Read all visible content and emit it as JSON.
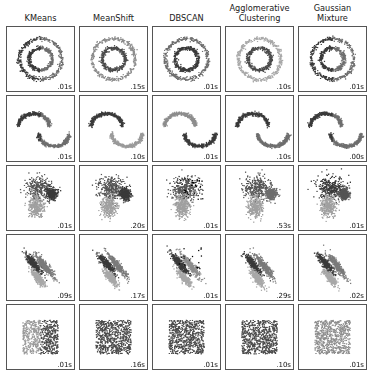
{
  "figure": {
    "title": "",
    "background": "#ffffff",
    "panel_border_color": "#555555"
  },
  "columns": [
    {
      "id": "kmeans",
      "label": "KMeans"
    },
    {
      "id": "meanshift",
      "label": "MeanShift"
    },
    {
      "id": "dbscan",
      "label": "DBSCAN"
    },
    {
      "id": "agglomerative",
      "label": "Agglomerative\nClustering"
    },
    {
      "id": "gaussian_mixture",
      "label": "Gaussian\nMixture"
    }
  ],
  "rows": [
    {
      "id": "noisy_circles",
      "label": ""
    },
    {
      "id": "noisy_moons",
      "label": ""
    },
    {
      "id": "varied_blobs",
      "label": ""
    },
    {
      "id": "aniso_blobs",
      "label": ""
    },
    {
      "id": "uniform_noise",
      "label": ""
    }
  ],
  "timings": {
    "noisy_circles": [
      ".01s",
      ".15s",
      ".01s",
      ".10s",
      ".01s"
    ],
    "noisy_moons": [
      ".01s",
      ".10s",
      ".01s",
      ".10s",
      ".00s"
    ],
    "varied_blobs": [
      ".01s",
      ".20s",
      ".01s",
      ".53s",
      ".01s"
    ],
    "aniso_blobs": [
      ".09s",
      ".17s",
      ".01s",
      ".29s",
      ".02s"
    ],
    "uniform_noise": [
      ".01s",
      ".16s",
      ".01s",
      ".10s",
      ".01s"
    ]
  },
  "palette": {
    "cluster_dark": "#3a3a3a",
    "cluster_mid": "#6e6e6e",
    "cluster_light": "#a8a8a8",
    "cluster_lighter": "#c4c4c4",
    "noise_black": "#000000"
  },
  "chart_data": {
    "type": "scatter",
    "title": "",
    "xlabel": "",
    "ylabel": "",
    "xlim": [
      -2.5,
      2.5
    ],
    "ylim": [
      -2.5,
      2.5
    ],
    "grid": false,
    "legend": null,
    "axis_ticks": "none",
    "layout": {
      "rows": 5,
      "cols": 5,
      "n_samples_per_panel": 1500
    },
    "col_labels": [
      "KMeans",
      "MeanShift",
      "DBSCAN",
      "Agglomerative Clustering",
      "Gaussian Mixture"
    ],
    "row_datasets": [
      "noisy_circles",
      "noisy_moons",
      "varied_blobs",
      "aniso_blobs",
      "uniform_noise"
    ],
    "annotations": [
      {
        "row": "noisy_circles",
        "col": "KMeans",
        "text": ".01s",
        "position": "bottom-right"
      },
      {
        "row": "noisy_circles",
        "col": "MeanShift",
        "text": ".15s",
        "position": "bottom-right"
      },
      {
        "row": "noisy_circles",
        "col": "DBSCAN",
        "text": ".01s",
        "position": "bottom-right"
      },
      {
        "row": "noisy_circles",
        "col": "Agglomerative Clustering",
        "text": ".10s",
        "position": "bottom-right"
      },
      {
        "row": "noisy_circles",
        "col": "Gaussian Mixture",
        "text": ".01s",
        "position": "bottom-right"
      },
      {
        "row": "noisy_moons",
        "col": "KMeans",
        "text": ".01s",
        "position": "bottom-right"
      },
      {
        "row": "noisy_moons",
        "col": "MeanShift",
        "text": ".10s",
        "position": "bottom-right"
      },
      {
        "row": "noisy_moons",
        "col": "DBSCAN",
        "text": ".01s",
        "position": "bottom-right"
      },
      {
        "row": "noisy_moons",
        "col": "Agglomerative Clustering",
        "text": ".10s",
        "position": "bottom-right"
      },
      {
        "row": "noisy_moons",
        "col": "Gaussian Mixture",
        "text": ".00s",
        "position": "bottom-right"
      },
      {
        "row": "varied_blobs",
        "col": "KMeans",
        "text": ".01s",
        "position": "bottom-right"
      },
      {
        "row": "varied_blobs",
        "col": "MeanShift",
        "text": ".20s",
        "position": "bottom-right"
      },
      {
        "row": "varied_blobs",
        "col": "DBSCAN",
        "text": ".01s",
        "position": "bottom-right"
      },
      {
        "row": "varied_blobs",
        "col": "Agglomerative Clustering",
        "text": ".53s",
        "position": "bottom-right"
      },
      {
        "row": "varied_blobs",
        "col": "Gaussian Mixture",
        "text": ".01s",
        "position": "bottom-right"
      },
      {
        "row": "aniso_blobs",
        "col": "KMeans",
        "text": ".09s",
        "position": "bottom-right"
      },
      {
        "row": "aniso_blobs",
        "col": "MeanShift",
        "text": ".17s",
        "position": "bottom-right"
      },
      {
        "row": "aniso_blobs",
        "col": "DBSCAN",
        "text": ".01s",
        "position": "bottom-right"
      },
      {
        "row": "aniso_blobs",
        "col": "Agglomerative Clustering",
        "text": ".29s",
        "position": "bottom-right"
      },
      {
        "row": "aniso_blobs",
        "col": "Gaussian Mixture",
        "text": ".02s",
        "position": "bottom-right"
      },
      {
        "row": "uniform_noise",
        "col": "KMeans",
        "text": ".01s",
        "position": "bottom-right"
      },
      {
        "row": "uniform_noise",
        "col": "MeanShift",
        "text": ".16s",
        "position": "bottom-right"
      },
      {
        "row": "uniform_noise",
        "col": "DBSCAN",
        "text": ".01s",
        "position": "bottom-right"
      },
      {
        "row": "uniform_noise",
        "col": "Agglomerative Clustering",
        "text": ".10s",
        "position": "bottom-right"
      },
      {
        "row": "uniform_noise",
        "col": "Gaussian Mixture",
        "text": ".01s",
        "position": "bottom-right"
      }
    ],
    "panels": [
      {
        "row": "noisy_circles",
        "col": "kmeans",
        "dataset": "circles",
        "clusters": [
          {
            "color": "#6e6e6e",
            "shape": "ring_half",
            "ring": "outer",
            "angle_from": -90,
            "angle_to": 90
          },
          {
            "color": "#3a3a3a",
            "shape": "ring_half",
            "ring": "outer",
            "angle_from": 90,
            "angle_to": 270
          },
          {
            "color": "#6e6e6e",
            "shape": "ring_half",
            "ring": "inner",
            "angle_from": -90,
            "angle_to": 90
          },
          {
            "color": "#3a3a3a",
            "shape": "ring_half",
            "ring": "inner",
            "angle_from": 90,
            "angle_to": 270
          }
        ]
      },
      {
        "row": "noisy_circles",
        "col": "meanshift",
        "dataset": "circles",
        "clusters": [
          {
            "color": "#8d8d8d",
            "shape": "ring",
            "ring": "outer"
          },
          {
            "color": "#4a4a4a",
            "shape": "ring",
            "ring": "inner"
          }
        ]
      },
      {
        "row": "noisy_circles",
        "col": "dbscan",
        "dataset": "circles",
        "clusters": [
          {
            "color": "#6e6e6e",
            "shape": "ring",
            "ring": "outer"
          },
          {
            "color": "#3a3a3a",
            "shape": "ring",
            "ring": "inner"
          }
        ]
      },
      {
        "row": "noisy_circles",
        "col": "agglomerative",
        "dataset": "circles",
        "clusters": [
          {
            "color": "#a8a8a8",
            "shape": "ring",
            "ring": "outer"
          },
          {
            "color": "#4a4a4a",
            "shape": "ring",
            "ring": "inner"
          }
        ]
      },
      {
        "row": "noisy_circles",
        "col": "gaussian_mixture",
        "dataset": "circles",
        "clusters": [
          {
            "color": "#6e6e6e",
            "shape": "ring_half",
            "ring": "outer",
            "angle_from": -90,
            "angle_to": 90
          },
          {
            "color": "#3a3a3a",
            "shape": "ring_half",
            "ring": "outer",
            "angle_from": 90,
            "angle_to": 270
          },
          {
            "color": "#6e6e6e",
            "shape": "ring_half",
            "ring": "inner",
            "angle_from": -90,
            "angle_to": 90
          },
          {
            "color": "#3a3a3a",
            "shape": "ring_half",
            "ring": "inner",
            "angle_from": 90,
            "angle_to": 270
          }
        ]
      },
      {
        "row": "noisy_moons",
        "col": "kmeans",
        "dataset": "moons",
        "clusters": [
          {
            "color": "#3a3a3a",
            "shape": "moon_split",
            "part": "left"
          },
          {
            "color": "#6e6e6e",
            "shape": "moon_split",
            "part": "right"
          }
        ]
      },
      {
        "row": "noisy_moons",
        "col": "meanshift",
        "dataset": "moons",
        "clusters": [
          {
            "color": "#3a3a3a",
            "shape": "moon",
            "part": "upper"
          },
          {
            "color": "#9a9a9a",
            "shape": "moon",
            "part": "lower"
          }
        ]
      },
      {
        "row": "noisy_moons",
        "col": "dbscan",
        "dataset": "moons",
        "clusters": [
          {
            "color": "#8d8d8d",
            "shape": "moon",
            "part": "upper"
          },
          {
            "color": "#3a3a3a",
            "shape": "moon",
            "part": "lower"
          }
        ]
      },
      {
        "row": "noisy_moons",
        "col": "agglomerative",
        "dataset": "moons",
        "clusters": [
          {
            "color": "#3a3a3a",
            "shape": "moon",
            "part": "upper"
          },
          {
            "color": "#6e6e6e",
            "shape": "moon",
            "part": "lower"
          }
        ]
      },
      {
        "row": "noisy_moons",
        "col": "gaussian_mixture",
        "dataset": "moons",
        "clusters": [
          {
            "color": "#3a3a3a",
            "shape": "moon_split",
            "part": "left"
          },
          {
            "color": "#6e6e6e",
            "shape": "moon_split",
            "part": "right"
          }
        ]
      },
      {
        "row": "varied_blobs",
        "col": "kmeans",
        "dataset": "varied",
        "clusters": [
          {
            "color": "#555555",
            "shape": "blob",
            "cx": -0.15,
            "cy": 0.85,
            "sx": 0.55,
            "sy": 0.5
          },
          {
            "color": "#3a3a3a",
            "shape": "blob",
            "cx": 0.95,
            "cy": 0.35,
            "sx": 0.22,
            "sy": 0.25
          },
          {
            "color": "#a0a0a0",
            "shape": "blob",
            "cx": -0.35,
            "cy": -0.75,
            "sx": 0.3,
            "sy": 0.45
          }
        ]
      },
      {
        "row": "varied_blobs",
        "col": "meanshift",
        "dataset": "varied",
        "clusters": [
          {
            "color": "#555555",
            "shape": "blob",
            "cx": -0.15,
            "cy": 0.85,
            "sx": 0.55,
            "sy": 0.5
          },
          {
            "color": "#3a3a3a",
            "shape": "blob",
            "cx": 0.95,
            "cy": 0.35,
            "sx": 0.22,
            "sy": 0.25
          },
          {
            "color": "#a0a0a0",
            "shape": "blob",
            "cx": -0.35,
            "cy": -0.75,
            "sx": 0.3,
            "sy": 0.45
          }
        ]
      },
      {
        "row": "varied_blobs",
        "col": "dbscan",
        "dataset": "varied",
        "clusters": [
          {
            "color": "#555555",
            "shape": "blob",
            "cx": -0.15,
            "cy": 0.85,
            "sx": 0.55,
            "sy": 0.5
          },
          {
            "color": "#000000",
            "shape": "noise_points",
            "count": 40
          },
          {
            "color": "#a0a0a0",
            "shape": "blob",
            "cx": -0.35,
            "cy": -0.75,
            "sx": 0.3,
            "sy": 0.45
          }
        ]
      },
      {
        "row": "varied_blobs",
        "col": "agglomerative",
        "dataset": "varied",
        "clusters": [
          {
            "color": "#555555",
            "shape": "blob",
            "cx": -0.15,
            "cy": 0.85,
            "sx": 0.55,
            "sy": 0.5
          },
          {
            "color": "#6e6e6e",
            "shape": "blob",
            "cx": 0.95,
            "cy": 0.35,
            "sx": 0.22,
            "sy": 0.25
          },
          {
            "color": "#a0a0a0",
            "shape": "blob",
            "cx": -0.35,
            "cy": -0.75,
            "sx": 0.3,
            "sy": 0.45
          }
        ]
      },
      {
        "row": "varied_blobs",
        "col": "gaussian_mixture",
        "dataset": "varied",
        "clusters": [
          {
            "color": "#3a3a3a",
            "shape": "blob",
            "cx": -0.15,
            "cy": 0.85,
            "sx": 0.55,
            "sy": 0.5
          },
          {
            "color": "#555555",
            "shape": "blob",
            "cx": 0.95,
            "cy": 0.35,
            "sx": 0.22,
            "sy": 0.25
          },
          {
            "color": "#a0a0a0",
            "shape": "blob",
            "cx": -0.35,
            "cy": -0.75,
            "sx": 0.3,
            "sy": 0.45
          }
        ]
      },
      {
        "row": "aniso_blobs",
        "col": "kmeans",
        "dataset": "aniso",
        "clusters": [
          {
            "color": "#3a3a3a",
            "shape": "streak",
            "cx": -0.55,
            "cy": 0.3,
            "len": 1.25,
            "angle": -52
          },
          {
            "color": "#7a7a7a",
            "shape": "streak",
            "cx": 0.35,
            "cy": 0.15,
            "len": 1.5,
            "angle": -52
          },
          {
            "color": "#a8a8a8",
            "shape": "streak",
            "cx": -0.2,
            "cy": -0.9,
            "len": 1.0,
            "angle": -52
          }
        ]
      },
      {
        "row": "aniso_blobs",
        "col": "meanshift",
        "dataset": "aniso",
        "clusters": [
          {
            "color": "#3a3a3a",
            "shape": "streak",
            "cx": -0.55,
            "cy": 0.3,
            "len": 1.25,
            "angle": -52
          },
          {
            "color": "#7a7a7a",
            "shape": "streak",
            "cx": 0.35,
            "cy": 0.15,
            "len": 1.5,
            "angle": -52
          },
          {
            "color": "#a8a8a8",
            "shape": "streak",
            "cx": -0.2,
            "cy": -0.9,
            "len": 1.0,
            "angle": -52
          }
        ]
      },
      {
        "row": "aniso_blobs",
        "col": "dbscan",
        "dataset": "aniso",
        "clusters": [
          {
            "color": "#3a3a3a",
            "shape": "streak",
            "cx": -0.55,
            "cy": 0.3,
            "len": 1.25,
            "angle": -52
          },
          {
            "color": "#8d8d8d",
            "shape": "streak",
            "cx": 0.35,
            "cy": 0.15,
            "len": 1.5,
            "angle": -52
          },
          {
            "color": "#a8a8a8",
            "shape": "streak",
            "cx": -0.2,
            "cy": -0.9,
            "len": 1.0,
            "angle": -52
          },
          {
            "color": "#000000",
            "shape": "noise_points",
            "count": 18
          }
        ]
      },
      {
        "row": "aniso_blobs",
        "col": "agglomerative",
        "dataset": "aniso",
        "clusters": [
          {
            "color": "#3a3a3a",
            "shape": "streak",
            "cx": -0.55,
            "cy": 0.3,
            "len": 1.25,
            "angle": -52
          },
          {
            "color": "#7a7a7a",
            "shape": "streak",
            "cx": 0.35,
            "cy": 0.15,
            "len": 1.5,
            "angle": -52
          },
          {
            "color": "#a8a8a8",
            "shape": "streak",
            "cx": -0.2,
            "cy": -0.9,
            "len": 1.0,
            "angle": -52
          }
        ]
      },
      {
        "row": "aniso_blobs",
        "col": "gaussian_mixture",
        "dataset": "aniso",
        "clusters": [
          {
            "color": "#3a3a3a",
            "shape": "streak",
            "cx": -0.55,
            "cy": 0.3,
            "len": 1.25,
            "angle": -52
          },
          {
            "color": "#7a7a7a",
            "shape": "streak",
            "cx": 0.35,
            "cy": 0.15,
            "len": 1.5,
            "angle": -52
          },
          {
            "color": "#a8a8a8",
            "shape": "streak",
            "cx": -0.2,
            "cy": -0.9,
            "len": 1.0,
            "angle": -52
          }
        ]
      },
      {
        "row": "uniform_noise",
        "col": "kmeans",
        "dataset": "uniform",
        "clusters": [
          {
            "color": "#9a9a9a",
            "shape": "square_half",
            "part": "left"
          },
          {
            "color": "#4a4a4a",
            "shape": "square_half",
            "part": "right"
          }
        ]
      },
      {
        "row": "uniform_noise",
        "col": "meanshift",
        "dataset": "uniform",
        "clusters": [
          {
            "color": "#4a4a4a",
            "shape": "square_full"
          }
        ]
      },
      {
        "row": "uniform_noise",
        "col": "dbscan",
        "dataset": "uniform",
        "clusters": [
          {
            "color": "#4a4a4a",
            "shape": "square_full"
          }
        ]
      },
      {
        "row": "uniform_noise",
        "col": "agglomerative",
        "dataset": "uniform",
        "clusters": [
          {
            "color": "#4a4a4a",
            "shape": "square_full"
          }
        ]
      },
      {
        "row": "uniform_noise",
        "col": "gaussian_mixture",
        "dataset": "uniform",
        "clusters": [
          {
            "color": "#8d8d8d",
            "shape": "square_full"
          }
        ]
      }
    ]
  }
}
